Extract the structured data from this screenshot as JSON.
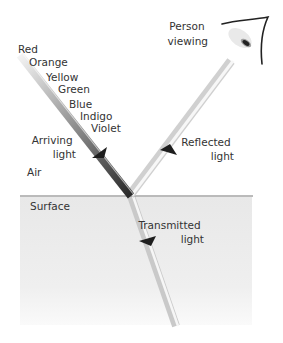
{
  "labels": {
    "person_viewing": [
      "Person",
      "viewing"
    ],
    "spectrum": [
      "Red",
      "Orange",
      "Yellow",
      "Green",
      "Blue",
      "Indigo",
      "Violet"
    ],
    "arriving_light": [
      "Arriving",
      "light"
    ],
    "reflected_light": [
      "Reflected",
      "light"
    ],
    "air": "Air",
    "surface": "Surface",
    "transmitted_light": [
      "Transmitted",
      "light"
    ]
  },
  "colors": {
    "background": "#ffffff",
    "medium": "#ebebeb",
    "surface_line": "#777777",
    "arrow": "#1e1e1e",
    "text": "#333333"
  }
}
